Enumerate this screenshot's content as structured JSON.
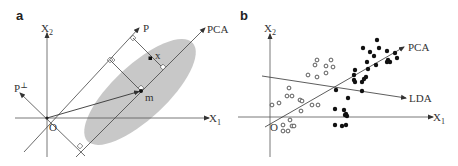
{
  "figure": {
    "panels": [
      {
        "id": "a",
        "label": "a",
        "axes": {
          "x_label": "X",
          "x_sub": "1",
          "y_label": "X",
          "y_sub": "2",
          "origin_label": "O"
        },
        "projection_axis_label": "P",
        "perp_axis_label": "P",
        "perp_axis_sup": "⊥",
        "pca_label": "PCA",
        "mean_label": "m",
        "sample_label": "x",
        "ellipse_color": "#c8c8c8"
      },
      {
        "id": "b",
        "label": "b",
        "axes": {
          "x_label": "X",
          "x_sub": "1",
          "y_label": "X",
          "y_sub": "2",
          "origin_label": "O"
        },
        "pca_label": "PCA",
        "lda_label": "LDA",
        "class_open": [
          [
            283,
            125
          ],
          [
            290,
            120
          ],
          [
            292,
            126
          ],
          [
            294,
            126
          ],
          [
            283,
            131
          ],
          [
            288,
            131
          ],
          [
            272,
            105
          ],
          [
            279,
            103
          ],
          [
            287,
            96
          ],
          [
            292,
            96
          ],
          [
            300,
            100
          ],
          [
            301,
            111
          ],
          [
            302,
            101
          ],
          [
            312,
            105
          ],
          [
            318,
            105
          ],
          [
            289,
            88
          ],
          [
            308,
            75
          ],
          [
            317,
            77
          ],
          [
            326,
            73
          ],
          [
            315,
            65
          ],
          [
            317,
            60
          ],
          [
            326,
            66
          ],
          [
            331,
            60
          ],
          [
            333,
            67
          ]
        ],
        "class_filled": [
          [
            335,
            125
          ],
          [
            342,
            126
          ],
          [
            346,
            125
          ],
          [
            335,
            109
          ],
          [
            344,
            110
          ],
          [
            345,
            115
          ],
          [
            346,
            114
          ],
          [
            347,
            116
          ],
          [
            348,
            98
          ],
          [
            336,
            90
          ],
          [
            362,
            91
          ],
          [
            354,
            80
          ],
          [
            355,
            82
          ],
          [
            354,
            75
          ],
          [
            355,
            70
          ],
          [
            362,
            82
          ],
          [
            364,
            79
          ],
          [
            366,
            77
          ],
          [
            368,
            69
          ],
          [
            367,
            62
          ],
          [
            374,
            56
          ],
          [
            376,
            65
          ],
          [
            363,
            48
          ],
          [
            370,
            52
          ],
          [
            379,
            48
          ],
          [
            377,
            40
          ],
          [
            387,
            51
          ],
          [
            388,
            60
          ],
          [
            390,
            62
          ],
          [
            395,
            53
          ],
          [
            387,
            62
          ],
          [
            397,
            58
          ]
        ]
      }
    ]
  }
}
